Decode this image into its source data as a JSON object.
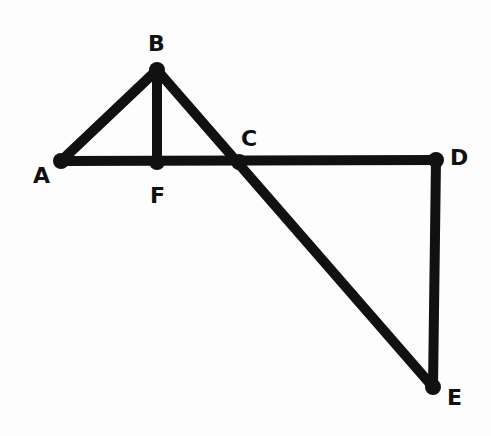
{
  "diagram": {
    "type": "geometry",
    "stroke_color": "#111111",
    "background": "#fdfdfd",
    "points": [
      {
        "id": "A",
        "label": "A",
        "x": 61,
        "y": 161,
        "label_x": 33,
        "label_y": 165
      },
      {
        "id": "B",
        "label": "B",
        "x": 157,
        "y": 70,
        "label_x": 148,
        "label_y": 33
      },
      {
        "id": "C",
        "label": "C",
        "x": 239,
        "y": 162,
        "label_x": 241,
        "label_y": 128
      },
      {
        "id": "D",
        "label": "D",
        "x": 436,
        "y": 160,
        "label_x": 450,
        "label_y": 147
      },
      {
        "id": "E",
        "label": "E",
        "x": 433,
        "y": 387,
        "label_x": 447,
        "label_y": 387
      },
      {
        "id": "F",
        "label": "F",
        "x": 157,
        "y": 162,
        "label_x": 150,
        "label_y": 185
      }
    ],
    "segments": [
      [
        "A",
        "B"
      ],
      [
        "B",
        "F"
      ],
      [
        "B",
        "E"
      ],
      [
        "A",
        "D"
      ],
      [
        "D",
        "E"
      ]
    ]
  }
}
